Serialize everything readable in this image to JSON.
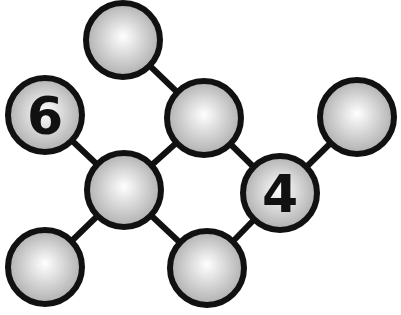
{
  "diagram": {
    "type": "graph",
    "canvas": {
      "width": 401,
      "height": 315,
      "background": "#ffffff"
    },
    "style": {
      "stroke": "#111111",
      "node_fill_light": "#ffffff",
      "node_fill_dark": "#a8a8a8",
      "node_radius": 37,
      "edge_width": 6,
      "node_stroke_width": 6
    },
    "nodes": [
      {
        "id": "n_top",
        "x": 123,
        "y": 40,
        "label": ""
      },
      {
        "id": "n_six",
        "x": 45,
        "y": 115,
        "label": "6"
      },
      {
        "id": "n_upmid",
        "x": 204,
        "y": 118,
        "label": ""
      },
      {
        "id": "n_right",
        "x": 357,
        "y": 117,
        "label": ""
      },
      {
        "id": "n_center",
        "x": 124,
        "y": 190,
        "label": ""
      },
      {
        "id": "n_four",
        "x": 280,
        "y": 193,
        "label": "4"
      },
      {
        "id": "n_botleft",
        "x": 45,
        "y": 267,
        "label": ""
      },
      {
        "id": "n_botmid",
        "x": 207,
        "y": 268,
        "label": ""
      }
    ],
    "edges": [
      [
        "n_top",
        "n_upmid"
      ],
      [
        "n_six",
        "n_center"
      ],
      [
        "n_upmid",
        "n_center"
      ],
      [
        "n_upmid",
        "n_four"
      ],
      [
        "n_right",
        "n_four"
      ],
      [
        "n_center",
        "n_botleft"
      ],
      [
        "n_center",
        "n_botmid"
      ],
      [
        "n_botmid",
        "n_four"
      ]
    ]
  }
}
